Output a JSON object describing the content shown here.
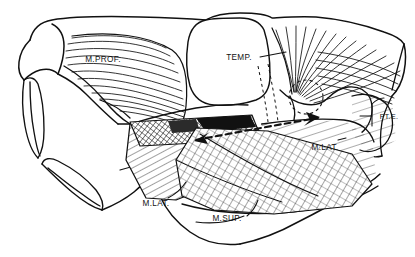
{
  "figure": {
    "background_color": "#ffffff",
    "line_color": "#111111",
    "width": 415,
    "height": 257
  },
  "labels": {
    "masseter_profundus": "M.PROF.",
    "temporalis": "TEMP.",
    "pterygoideus_externus": "PT.E.",
    "masseter_lateralis_posterior": "M.LAT.",
    "masseter_lateralis_anterior": "M.LAT.",
    "masseter_superficialis": "M.SUP."
  },
  "annotations": {
    "condyle_marker": "dashed-circle",
    "pterygoid_arrow": "dashed-arrow"
  }
}
